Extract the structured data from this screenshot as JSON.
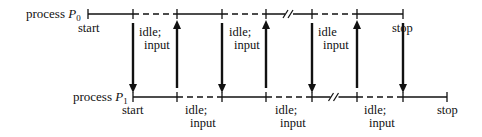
{
  "processes": [
    {
      "id": "P0",
      "label_prefix": "process ",
      "label_var": "P",
      "label_sub": "0",
      "y": 14,
      "ticks": [
        88,
        133,
        177,
        222,
        266,
        312,
        357,
        403
      ],
      "segments": [
        {
          "from": 88,
          "to": 133,
          "style": "solid"
        },
        {
          "from": 133,
          "to": 177,
          "style": "dashed"
        },
        {
          "from": 177,
          "to": 222,
          "style": "solid"
        },
        {
          "from": 222,
          "to": 266,
          "style": "dashed"
        },
        {
          "from": 266,
          "to": 312,
          "style": "solid",
          "break": true
        },
        {
          "from": 312,
          "to": 357,
          "style": "dashed"
        },
        {
          "from": 357,
          "to": 403,
          "style": "solid"
        }
      ],
      "labels": [
        {
          "text": "start",
          "x": 78,
          "y": 22
        },
        {
          "line1": "idle;",
          "line2": "input",
          "x": 139,
          "y": 26
        },
        {
          "line1": "idle;",
          "line2": "input",
          "x": 229,
          "y": 26
        },
        {
          "line1": "idle",
          "line2": "input",
          "x": 318,
          "y": 26
        },
        {
          "text": "stop",
          "x": 392,
          "y": 22
        }
      ]
    },
    {
      "id": "P1",
      "label_prefix": "process ",
      "label_var": "P",
      "label_sub": "1",
      "y": 97,
      "ticks": [
        133,
        177,
        222,
        266,
        312,
        357,
        403,
        447
      ],
      "segments": [
        {
          "from": 133,
          "to": 177,
          "style": "solid"
        },
        {
          "from": 177,
          "to": 222,
          "style": "dashed"
        },
        {
          "from": 222,
          "to": 266,
          "style": "solid"
        },
        {
          "from": 266,
          "to": 312,
          "style": "dashed"
        },
        {
          "from": 312,
          "to": 357,
          "style": "solid",
          "break": true
        },
        {
          "from": 357,
          "to": 403,
          "style": "dashed"
        },
        {
          "from": 403,
          "to": 447,
          "style": "solid"
        }
      ],
      "labels": [
        {
          "text": "start",
          "x": 122,
          "y": 104
        },
        {
          "line1": "idle;",
          "line2": "input",
          "x": 185,
          "y": 104
        },
        {
          "line1": "idle;",
          "line2": "input",
          "x": 275,
          "y": 104
        },
        {
          "line1": "idle;",
          "line2": "input",
          "x": 364,
          "y": 104
        },
        {
          "text": "stop",
          "x": 437,
          "y": 104
        }
      ]
    }
  ],
  "arrows": [
    {
      "x": 133,
      "direction": "down",
      "meaning": "P0 to P1"
    },
    {
      "x": 177,
      "direction": "up",
      "meaning": "P1 to P0"
    },
    {
      "x": 222,
      "direction": "down",
      "meaning": "P0 to P1"
    },
    {
      "x": 266,
      "direction": "up",
      "meaning": "P1 to P0"
    },
    {
      "x": 312,
      "direction": "down",
      "meaning": "P0 to P1"
    },
    {
      "x": 357,
      "direction": "up",
      "meaning": "P1 to P0"
    },
    {
      "x": 403,
      "direction": "down",
      "meaning": "P0 to P1"
    }
  ],
  "labels": {
    "p0_prefix": "process ",
    "p0_var": "P",
    "p0_sub": "0",
    "p1_prefix": "process ",
    "p1_var": "P",
    "p1_sub": "1",
    "p0_start": "start",
    "p0_idle1_a": "idle;",
    "p0_idle1_b": "input",
    "p0_idle2_a": "idle;",
    "p0_idle2_b": "input",
    "p0_idle3_a": "idle",
    "p0_idle3_b": "input",
    "p0_stop": "stop",
    "p1_start": "start",
    "p1_idle1_a": "idle;",
    "p1_idle1_b": "input",
    "p1_idle2_a": "idle;",
    "p1_idle2_b": "input",
    "p1_idle3_a": "idle;",
    "p1_idle3_b": "input",
    "p1_stop": "stop"
  },
  "colors": {
    "ink": "#111111",
    "background": "#ffffff"
  }
}
